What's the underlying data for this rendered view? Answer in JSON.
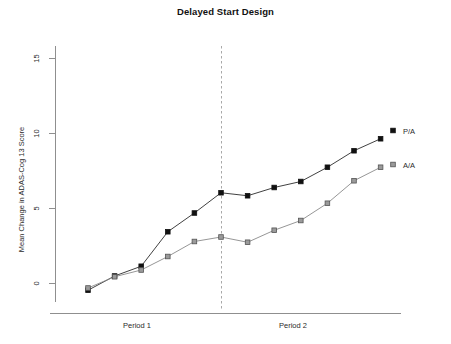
{
  "chart_data": {
    "type": "line",
    "title": "Delayed Start Design",
    "xlabel": "",
    "ylabel": "Mean Change in ADAS-Cog 13 Score",
    "ylim": [
      -2.2,
      16.2
    ],
    "xlim": [
      0,
      13
    ],
    "yticks": [
      0,
      5,
      10,
      15
    ],
    "ytick_labels": [
      "0",
      "5",
      "10",
      "15"
    ],
    "grid": false,
    "legend_position": "right-inline",
    "x": [
      1,
      2,
      3,
      4,
      5,
      6,
      7,
      8,
      9,
      10,
      11,
      12
    ],
    "series": [
      {
        "name": "P/A",
        "marker": "filled-square",
        "color": "#111111",
        "values": [
          -0.45,
          0.5,
          1.15,
          3.45,
          4.7,
          6.05,
          5.85,
          6.4,
          6.8,
          7.75,
          8.85,
          9.65
        ]
      },
      {
        "name": "A/A",
        "marker": "grey-square",
        "color": "#7a7a7a",
        "values": [
          -0.3,
          0.45,
          0.9,
          1.8,
          2.8,
          3.1,
          2.75,
          3.55,
          4.2,
          5.35,
          6.85,
          7.75
        ]
      }
    ],
    "annotations": [
      {
        "type": "vline",
        "x": 6,
        "style": "dashed",
        "color": "#a8a8a8"
      }
    ],
    "xtick_groups": [
      {
        "label": "Period 1",
        "center_x": 3.25
      },
      {
        "label": "Period 2",
        "center_x": 9.2
      }
    ]
  },
  "legend": {
    "entries": [
      {
        "label": "P/A"
      },
      {
        "label": "A/A"
      }
    ]
  }
}
